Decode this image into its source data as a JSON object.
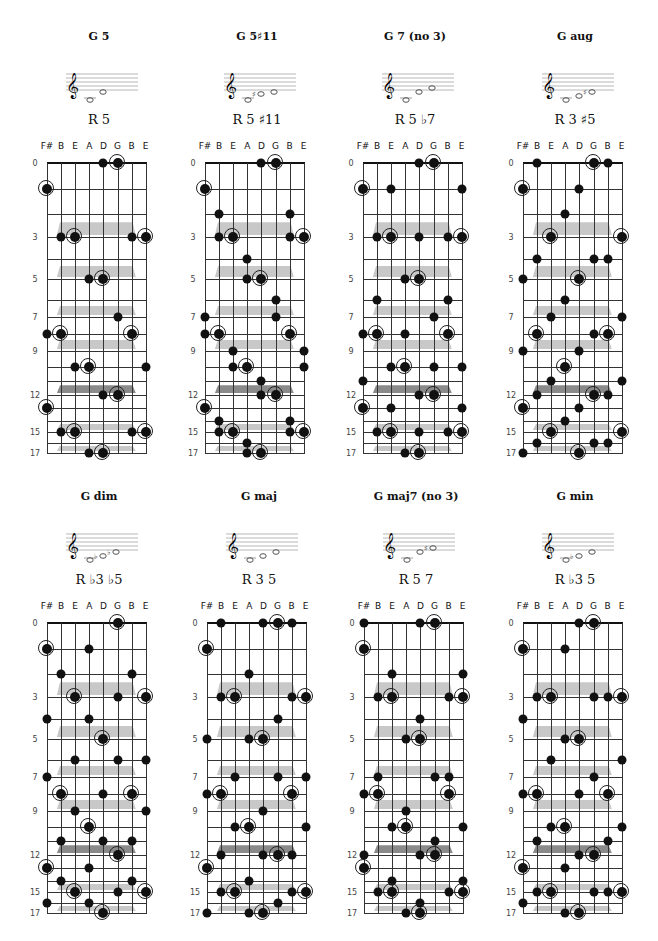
{
  "tuning": {
    "strings": [
      "F#",
      "B",
      "E",
      "A",
      "D",
      "G",
      "B",
      "E"
    ],
    "open_pitch_classes": [
      6,
      11,
      4,
      9,
      2,
      7,
      11,
      4
    ]
  },
  "fret_labels": [
    "0",
    "3",
    "5",
    "7",
    "9",
    "12",
    "15",
    "17"
  ],
  "fret_label_values": [
    0,
    3,
    5,
    7,
    9,
    12,
    15,
    17
  ],
  "max_fret": 17,
  "inlays": [
    {
      "between": [
        2,
        3
      ],
      "dark": false
    },
    {
      "between": [
        4,
        5
      ],
      "dark": false
    },
    {
      "between": [
        6,
        7
      ],
      "dark": false
    },
    {
      "between": [
        8,
        9
      ],
      "dark": false
    },
    {
      "between": [
        11,
        12
      ],
      "dark": true
    },
    {
      "between": [
        14,
        15
      ],
      "dark": false
    },
    {
      "between": [
        16,
        17
      ],
      "dark": false
    }
  ],
  "colors": {
    "dot": "#111111",
    "inlay": "#c8c8c8",
    "inlay_dark": "#8a8a8a",
    "line": "#333333"
  },
  "root_pitch_class": 7,
  "chords": [
    {
      "title": "G 5",
      "intervals": "R 5",
      "pitch_classes": [
        7,
        2
      ],
      "staff_notes": [
        "G",
        "D"
      ],
      "dots": [
        [
          0,
          1,
          1
        ],
        [
          0,
          8,
          0
        ],
        [
          0,
          13,
          1
        ],
        [
          1,
          3,
          0
        ],
        [
          1,
          8,
          1
        ],
        [
          1,
          15,
          0
        ],
        [
          2,
          3,
          1
        ],
        [
          2,
          10,
          0
        ],
        [
          2,
          15,
          1
        ],
        [
          3,
          5,
          0
        ],
        [
          3,
          10,
          1
        ],
        [
          3,
          17,
          0
        ],
        [
          4,
          0,
          0
        ],
        [
          4,
          5,
          1
        ],
        [
          4,
          12,
          0
        ],
        [
          4,
          17,
          1
        ],
        [
          5,
          0,
          1
        ],
        [
          5,
          7,
          0
        ],
        [
          5,
          12,
          1
        ],
        [
          6,
          3,
          0
        ],
        [
          6,
          8,
          1
        ],
        [
          6,
          15,
          0
        ],
        [
          7,
          3,
          1
        ],
        [
          7,
          10,
          0
        ],
        [
          7,
          15,
          1
        ]
      ]
    },
    {
      "title": "G 5♯11",
      "intervals": "R 5 ♯11",
      "pitch_classes": [
        7,
        2,
        1
      ],
      "staff_notes": [
        "G",
        "C#",
        "D"
      ],
      "dots": []
    },
    {
      "title": "G 7 (no 3)",
      "intervals": "R 5 ♭7",
      "pitch_classes": [
        7,
        2,
        5
      ],
      "staff_notes": [
        "G",
        "D",
        "F"
      ],
      "dots": []
    },
    {
      "title": "G aug",
      "intervals": "R 3 ♯5",
      "pitch_classes": [
        7,
        11,
        3
      ],
      "staff_notes": [
        "G",
        "B",
        "D#"
      ],
      "dots": []
    },
    {
      "title": "G dim",
      "intervals": "R ♭3 ♭5",
      "pitch_classes": [
        7,
        10,
        1
      ],
      "staff_notes": [
        "G",
        "Bb",
        "Db"
      ],
      "dots": []
    },
    {
      "title": "G maj",
      "intervals": "R 3 5",
      "pitch_classes": [
        7,
        11,
        2
      ],
      "staff_notes": [
        "G",
        "B",
        "D"
      ],
      "dots": []
    },
    {
      "title": "G maj7 (no 3)",
      "intervals": "R 5 7",
      "pitch_classes": [
        7,
        2,
        6
      ],
      "staff_notes": [
        "G",
        "D",
        "F#"
      ],
      "dots": []
    },
    {
      "title": "G min",
      "intervals": "R ♭3 5",
      "pitch_classes": [
        7,
        10,
        2
      ],
      "staff_notes": [
        "G",
        "Bb",
        "D"
      ],
      "dots": []
    }
  ]
}
